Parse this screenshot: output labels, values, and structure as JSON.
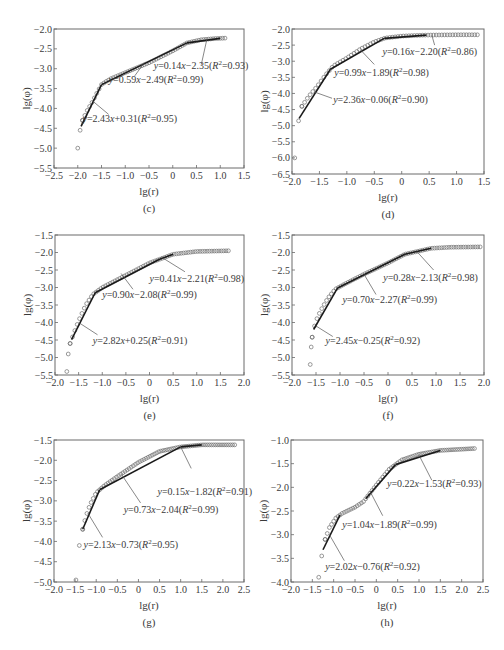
{
  "figure": {
    "y_axis_label": "lg(φ)",
    "x_axis_label": "lg(r)"
  },
  "chart_data": [
    {
      "id": "c",
      "type": "scatter",
      "caption": "(c)",
      "xlabel": "lg(r)",
      "ylabel": "lg(φ)",
      "xlim": [
        -2.5,
        1.5
      ],
      "ylim": [
        -5.5,
        -2.0
      ],
      "xticks": [
        -2.5,
        -2.0,
        -1.5,
        -1.0,
        -0.5,
        0,
        0.5,
        1.0,
        1.5
      ],
      "yticks": [
        -2.0,
        -2.5,
        -3.0,
        -3.5,
        -4.0,
        -4.5,
        -5.0,
        -5.5
      ],
      "frame_px": {
        "left": 54,
        "top": 29,
        "right": 244,
        "bottom": 168
      },
      "points_curve": [
        [
          -2.0,
          -5.0
        ],
        [
          -1.95,
          -4.55
        ],
        [
          -1.9,
          -4.3
        ],
        [
          -1.8,
          -4.05
        ],
        [
          -1.7,
          -3.85
        ],
        [
          -1.6,
          -3.62
        ],
        [
          -1.5,
          -3.4
        ],
        [
          -1.4,
          -3.32
        ],
        [
          -1.3,
          -3.25
        ],
        [
          -1.0,
          -3.1
        ],
        [
          -0.5,
          -2.85
        ],
        [
          0.0,
          -2.55
        ],
        [
          0.3,
          -2.35
        ],
        [
          0.6,
          -2.27
        ],
        [
          0.9,
          -2.24
        ],
        [
          1.1,
          -2.23
        ]
      ],
      "point_step": 0.05,
      "fits": [
        {
          "x": [
            -1.93,
            -1.5
          ],
          "eq": "y=2.43x+0.31",
          "r2": "0.95",
          "label_xy": [
            -1.9,
            -4.35
          ],
          "leader_from": [
            -1.68,
            -3.82
          ],
          "leader_to": [
            -1.35,
            -4.15
          ]
        },
        {
          "x": [
            -1.5,
            0.3
          ],
          "eq": "y=0.59x-2.49",
          "r2": "0.99",
          "label_xy": [
            -1.35,
            -3.35
          ],
          "leader_from": [
            -0.6,
            -2.85
          ],
          "leader_to": [
            -0.8,
            -3.18
          ]
        },
        {
          "x": [
            0.3,
            1.0
          ],
          "eq": "y=0.14x-2.35",
          "r2": "0.93",
          "label_xy": [
            -0.4,
            -3.0
          ],
          "leader_from": [
            0.72,
            -2.25
          ],
          "leader_to": [
            0.6,
            -2.9
          ]
        }
      ]
    },
    {
      "id": "d",
      "type": "scatter",
      "caption": "(d)",
      "xlabel": "lg(r)",
      "ylabel": "lg(φ)",
      "xlim": [
        -2.0,
        1.5
      ],
      "ylim": [
        -6.5,
        -2.0
      ],
      "xticks": [
        -2.0,
        -1.5,
        -1.0,
        -0.5,
        0,
        0.5,
        1.0,
        1.5
      ],
      "yticks": [
        -2.0,
        -2.5,
        -3.0,
        -3.5,
        -4.0,
        -4.5,
        -5.0,
        -5.5,
        -6.0,
        -6.5
      ],
      "frame_px": {
        "left": 292,
        "top": 29,
        "right": 484,
        "bottom": 174
      },
      "points_curve": [
        [
          -1.95,
          -6.0
        ],
        [
          -1.88,
          -4.85
        ],
        [
          -1.82,
          -4.4
        ],
        [
          -1.7,
          -4.1
        ],
        [
          -1.55,
          -3.8
        ],
        [
          -1.4,
          -3.45
        ],
        [
          -1.25,
          -3.15
        ],
        [
          -1.0,
          -2.9
        ],
        [
          -0.75,
          -2.62
        ],
        [
          -0.5,
          -2.4
        ],
        [
          -0.3,
          -2.28
        ],
        [
          0.0,
          -2.22
        ],
        [
          0.4,
          -2.19
        ],
        [
          1.0,
          -2.18
        ],
        [
          1.42,
          -2.18
        ]
      ],
      "point_step": 0.05,
      "fits": [
        {
          "x": [
            -1.87,
            -1.3
          ],
          "eq": "y=2.36x-0.06",
          "r2": "0.90",
          "label_xy": [
            -1.25,
            -4.3
          ],
          "leader_from": [
            -1.6,
            -3.95
          ],
          "leader_to": [
            -1.27,
            -4.15
          ]
        },
        {
          "x": [
            -1.3,
            -0.32
          ],
          "eq": "y=0.99x-1.89",
          "r2": "0.98",
          "label_xy": [
            -1.23,
            -3.45
          ],
          "leader_from": [
            -0.75,
            -2.65
          ],
          "leader_to": [
            -0.5,
            -3.1
          ]
        },
        {
          "x": [
            -0.32,
            0.45
          ],
          "eq": "y=0.16x-2.20",
          "r2": "0.86",
          "label_xy": [
            -0.35,
            -2.8
          ],
          "leader_from": [
            0.55,
            -2.2
          ],
          "leader_to": [
            0.6,
            -2.5
          ]
        }
      ]
    },
    {
      "id": "e",
      "type": "scatter",
      "caption": "(e)",
      "xlabel": "lg(r)",
      "ylabel": "lg(φ)",
      "xlim": [
        -2.0,
        2.0
      ],
      "ylim": [
        -5.5,
        -1.5
      ],
      "xticks": [
        -2.0,
        -1.5,
        -1.0,
        -0.5,
        0,
        0.5,
        1.0,
        1.5,
        2.0
      ],
      "yticks": [
        -1.5,
        -2.0,
        -2.5,
        -3.0,
        -3.5,
        -4.0,
        -4.5,
        -5.0,
        -5.5
      ],
      "frame_px": {
        "left": 55,
        "top": 235,
        "right": 244,
        "bottom": 375
      },
      "points_curve": [
        [
          -1.75,
          -5.4
        ],
        [
          -1.72,
          -4.9
        ],
        [
          -1.68,
          -4.6
        ],
        [
          -1.6,
          -4.3
        ],
        [
          -1.5,
          -3.95
        ],
        [
          -1.35,
          -3.5
        ],
        [
          -1.2,
          -3.2
        ],
        [
          -1.0,
          -3.0
        ],
        [
          -0.5,
          -2.65
        ],
        [
          0.0,
          -2.3
        ],
        [
          0.5,
          -2.05
        ],
        [
          1.0,
          -1.97
        ],
        [
          1.7,
          -1.95
        ]
      ],
      "point_step": 0.05,
      "fits": [
        {
          "x": [
            -1.65,
            -1.15
          ],
          "eq": "y=2.82x+0.25",
          "r2": "0.91",
          "label_xy": [
            -1.2,
            -4.6
          ],
          "leader_from": [
            -1.5,
            -4.0
          ],
          "leader_to": [
            -1.1,
            -4.35
          ]
        },
        {
          "x": [
            -1.15,
            0.2
          ],
          "eq": "y=0.90x-2.08",
          "r2": "0.99",
          "label_xy": [
            -1.0,
            -3.3
          ],
          "leader_from": [
            -0.6,
            -2.6
          ],
          "leader_to": [
            -0.35,
            -3.05
          ]
        },
        {
          "x": [
            0.2,
            0.5
          ],
          "eq": "y=0.41x-2.21",
          "r2": "0.98",
          "label_xy": [
            0.0,
            -2.85
          ],
          "leader_from": [
            0.25,
            -2.13
          ],
          "leader_to": [
            0.75,
            -2.55
          ]
        }
      ]
    },
    {
      "id": "f",
      "type": "scatter",
      "caption": "(f)",
      "xlabel": "lg(r)",
      "ylabel": "lg(φ)",
      "xlim": [
        -2.0,
        2.0
      ],
      "ylim": [
        -5.5,
        -1.5
      ],
      "xticks": [
        -2.0,
        -1.5,
        -1.0,
        -0.5,
        0,
        0.5,
        1.0,
        1.5,
        2.0
      ],
      "yticks": [
        -1.5,
        -2.0,
        -2.5,
        -3.0,
        -3.5,
        -4.0,
        -4.5,
        -5.0,
        -5.5
      ],
      "frame_px": {
        "left": 292,
        "top": 235,
        "right": 484,
        "bottom": 375
      },
      "points_curve": [
        [
          -1.62,
          -5.2
        ],
        [
          -1.6,
          -4.7
        ],
        [
          -1.58,
          -4.42
        ],
        [
          -1.55,
          -4.2
        ],
        [
          -1.5,
          -3.95
        ],
        [
          -1.4,
          -3.65
        ],
        [
          -1.25,
          -3.3
        ],
        [
          -1.1,
          -3.05
        ],
        [
          -0.9,
          -2.9
        ],
        [
          -0.5,
          -2.62
        ],
        [
          0.0,
          -2.3
        ],
        [
          0.35,
          -2.05
        ],
        [
          0.9,
          -1.88
        ],
        [
          1.3,
          -1.85
        ],
        [
          1.92,
          -1.84
        ]
      ],
      "point_step": 0.05,
      "fits": [
        {
          "x": [
            -1.55,
            -1.05
          ],
          "eq": "y=2.45x-0.25",
          "r2": "0.92",
          "label_xy": [
            -1.3,
            -4.6
          ],
          "leader_from": [
            -1.5,
            -4.1
          ],
          "leader_to": [
            -1.15,
            -4.4
          ]
        },
        {
          "x": [
            -1.05,
            0.35
          ],
          "eq": "y=0.70x-2.27",
          "r2": "0.99",
          "label_xy": [
            -0.95,
            -3.45
          ],
          "leader_from": [
            -0.5,
            -2.62
          ],
          "leader_to": [
            -0.25,
            -3.2
          ]
        },
        {
          "x": [
            0.35,
            0.9
          ],
          "eq": "y=0.28x-2.13",
          "r2": "0.98",
          "label_xy": [
            -0.1,
            -2.8
          ],
          "leader_from": [
            0.6,
            -1.97
          ],
          "leader_to": [
            0.95,
            -2.5
          ]
        }
      ]
    },
    {
      "id": "g",
      "type": "scatter",
      "caption": "(g)",
      "xlabel": "lg(r)",
      "ylabel": "lg(φ)",
      "xlim": [
        -2.0,
        2.5
      ],
      "ylim": [
        -5.0,
        -1.5
      ],
      "xticks": [
        -2.0,
        -1.5,
        -1.0,
        -0.5,
        0,
        0.5,
        1.0,
        1.5,
        2.0,
        2.5
      ],
      "yticks": [
        -1.5,
        -2.0,
        -2.5,
        -3.0,
        -3.5,
        -4.0,
        -4.5,
        -5.0
      ],
      "frame_px": {
        "left": 54,
        "top": 440,
        "right": 244,
        "bottom": 582
      },
      "points_curve": [
        [
          -1.48,
          -4.95
        ],
        [
          -1.4,
          -4.1
        ],
        [
          -1.32,
          -3.7
        ],
        [
          -1.25,
          -3.4
        ],
        [
          -1.15,
          -3.1
        ],
        [
          -1.0,
          -2.8
        ],
        [
          -0.8,
          -2.62
        ],
        [
          -0.5,
          -2.4
        ],
        [
          0.0,
          -2.05
        ],
        [
          0.5,
          -1.78
        ],
        [
          1.0,
          -1.67
        ],
        [
          1.5,
          -1.62
        ],
        [
          2.3,
          -1.62
        ]
      ],
      "point_step": 0.05,
      "fits": [
        {
          "x": [
            -1.32,
            -0.92
          ],
          "eq": "y=2.13x-0.73",
          "r2": "0.95",
          "label_xy": [
            -1.3,
            -4.15
          ],
          "leader_from": [
            -1.2,
            -3.3
          ],
          "leader_to": [
            -0.85,
            -3.9
          ]
        },
        {
          "x": [
            -0.92,
            1.0
          ],
          "eq": "y=0.73x-2.04",
          "r2": "0.99",
          "label_xy": [
            -0.35,
            -3.3
          ],
          "leader_from": [
            -0.4,
            -2.35
          ],
          "leader_to": [
            0.05,
            -3.05
          ]
        },
        {
          "x": [
            1.0,
            1.5
          ],
          "eq": "y=0.15x-1.82",
          "r2": "0.91",
          "label_xy": [
            0.45,
            -2.85
          ],
          "leader_from": [
            1.0,
            -1.67
          ],
          "leader_to": [
            1.25,
            -2.2
          ]
        }
      ]
    },
    {
      "id": "h",
      "type": "scatter",
      "caption": "(h)",
      "xlabel": "lg(r)",
      "ylabel": "lg(φ)",
      "xlim": [
        -2.0,
        2.5
      ],
      "ylim": [
        -4.0,
        -1.0
      ],
      "xticks": [
        -2.0,
        -1.5,
        -1.0,
        -0.5,
        0,
        0.5,
        1.0,
        1.5,
        2.0,
        2.5
      ],
      "yticks": [
        -1.0,
        -1.5,
        -2.0,
        -2.5,
        -3.0,
        -3.5,
        -4.0
      ],
      "frame_px": {
        "left": 291,
        "top": 440,
        "right": 483,
        "bottom": 582
      },
      "points_curve": [
        [
          -1.35,
          -3.9
        ],
        [
          -1.28,
          -3.45
        ],
        [
          -1.2,
          -3.1
        ],
        [
          -1.1,
          -2.85
        ],
        [
          -0.95,
          -2.65
        ],
        [
          -0.8,
          -2.55
        ],
        [
          -0.5,
          -2.42
        ],
        [
          -0.3,
          -2.3
        ],
        [
          0.0,
          -1.95
        ],
        [
          0.3,
          -1.62
        ],
        [
          0.6,
          -1.42
        ],
        [
          1.0,
          -1.3
        ],
        [
          1.5,
          -1.22
        ],
        [
          2.3,
          -1.18
        ]
      ],
      "point_step": 0.05,
      "fits": [
        {
          "x": [
            -1.25,
            -0.85
          ],
          "eq": "y=2.02x-0.76",
          "r2": "0.92",
          "label_xy": [
            -1.2,
            -3.75
          ],
          "leader_from": [
            -1.1,
            -3.0
          ],
          "leader_to": [
            -0.75,
            -3.55
          ]
        },
        {
          "x": [
            -0.25,
            0.45
          ],
          "eq": "y=1.04x-1.89",
          "r2": "0.99",
          "label_xy": [
            -0.8,
            -2.85
          ],
          "leader_from": [
            -0.15,
            -2.08
          ],
          "leader_to": [
            0.15,
            -2.6
          ]
        },
        {
          "x": [
            0.45,
            1.5
          ],
          "eq": "y=0.22x-1.53",
          "r2": "0.93",
          "label_xy": [
            0.25,
            -2.0
          ],
          "leader_from": [
            1.0,
            -1.32
          ],
          "leader_to": [
            1.3,
            -1.85
          ]
        }
      ]
    }
  ]
}
